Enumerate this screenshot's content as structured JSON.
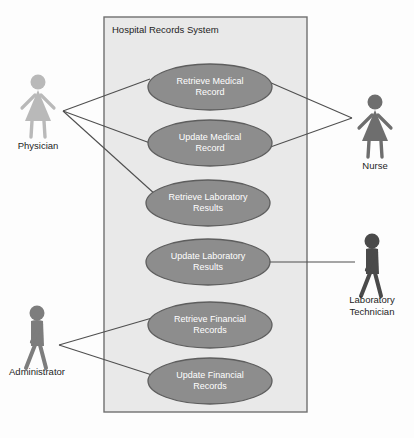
{
  "diagram": {
    "type": "uml-use-case-diagram",
    "system_boundary": {
      "title": "Hospital Records System",
      "x": 104,
      "y": 17,
      "width": 203,
      "height": 395,
      "fill": "#e9e9e9",
      "stroke": "#6f6f6f"
    },
    "use_case_style": {
      "fill": "#8d8d8d",
      "stroke": "#5e5e5e",
      "text_color": "#ffffff",
      "rx": 62,
      "ry": 23
    },
    "use_cases": [
      {
        "id": "retrieve-medical-record",
        "lines": [
          "Retrieve Medical",
          "Record"
        ],
        "cx": 210,
        "cy": 87
      },
      {
        "id": "update-medical-record",
        "lines": [
          "Update Medical",
          "Record"
        ],
        "cx": 210,
        "cy": 143
      },
      {
        "id": "retrieve-laboratory-results",
        "lines": [
          "Retrieve Laboratory",
          "Results"
        ],
        "cx": 208,
        "cy": 203
      },
      {
        "id": "update-laboratory-results",
        "lines": [
          "Update Laboratory",
          "Results"
        ],
        "cx": 208,
        "cy": 262
      },
      {
        "id": "retrieve-financial-records",
        "lines": [
          "Retrieve Financial",
          "Records"
        ],
        "cx": 210,
        "cy": 325
      },
      {
        "id": "update-financial-records",
        "lines": [
          "Update Financial",
          "Records"
        ],
        "cx": 210,
        "cy": 381
      }
    ],
    "actors": [
      {
        "id": "physician",
        "lines": [
          "Physician"
        ],
        "shape": "female",
        "x": 38,
        "y": 75,
        "color": "#b9b9b9",
        "label_y": 149
      },
      {
        "id": "nurse",
        "lines": [
          "Nurse"
        ],
        "shape": "female",
        "x": 375,
        "y": 95,
        "color": "#6e6e6e",
        "label_y": 169
      },
      {
        "id": "laboratory-technician",
        "lines": [
          "Laboratory",
          "Technician"
        ],
        "shape": "walker",
        "x": 372,
        "y": 234,
        "color": "#4a4a4a",
        "label_y": 303
      },
      {
        "id": "administrator",
        "lines": [
          "Administrator"
        ],
        "shape": "walker",
        "x": 37,
        "y": 306,
        "color": "#7d7d7d",
        "label_y": 375
      }
    ],
    "associations": [
      {
        "id": "physician-retrieve-medical-record",
        "actor": "physician",
        "use_case": "retrieve-medical-record",
        "x1": 63,
        "y1": 111,
        "x2": 150,
        "y2": 79
      },
      {
        "id": "physician-update-medical-record",
        "actor": "physician",
        "use_case": "update-medical-record",
        "x1": 63,
        "y1": 111,
        "x2": 150,
        "y2": 143
      },
      {
        "id": "physician-retrieve-laboratory-results",
        "actor": "physician",
        "use_case": "retrieve-laboratory-results",
        "x1": 63,
        "y1": 111,
        "x2": 156,
        "y2": 195
      },
      {
        "id": "nurse-retrieve-medical-record",
        "actor": "nurse",
        "use_case": "retrieve-medical-record",
        "x1": 352,
        "y1": 118,
        "x2": 262,
        "y2": 79
      },
      {
        "id": "nurse-update-medical-record",
        "actor": "nurse",
        "use_case": "update-medical-record",
        "x1": 352,
        "y1": 118,
        "x2": 262,
        "y2": 150
      },
      {
        "id": "laboratory-technician-update-lab-results",
        "actor": "laboratory-technician",
        "use_case": "update-laboratory-results",
        "x1": 355,
        "y1": 262,
        "x2": 262,
        "y2": 262
      },
      {
        "id": "administrator-retrieve-financial-records",
        "actor": "administrator",
        "use_case": "retrieve-financial-records",
        "x1": 59,
        "y1": 345,
        "x2": 152,
        "y2": 318
      },
      {
        "id": "administrator-update-financial-records",
        "actor": "administrator",
        "use_case": "update-financial-records",
        "x1": 59,
        "y1": 345,
        "x2": 152,
        "y2": 375
      }
    ],
    "line_color": "#4f4f4f"
  }
}
